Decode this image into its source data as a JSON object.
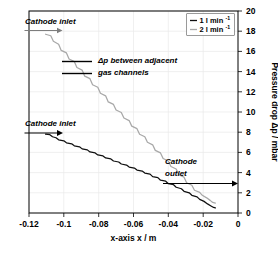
{
  "chart_data": {
    "type": "line",
    "title": "",
    "xlabel": "x-axis  x / m",
    "ylabel": "Pressure drop Δp / mbar",
    "xlim": [
      -0.12,
      0
    ],
    "ylim": [
      0,
      20
    ],
    "xticks": [
      -0.12,
      -0.1,
      -0.08,
      -0.06,
      -0.04,
      -0.02,
      0
    ],
    "xticklabels": [
      "-0.12",
      "-0.1",
      "-0.08",
      "-0.06",
      "-0.04",
      "-0.02",
      "0"
    ],
    "yticks": [
      0,
      2,
      4,
      6,
      8,
      10,
      12,
      14,
      16,
      18,
      20
    ],
    "yticklabels": [
      "0",
      "2",
      "4",
      "6",
      "8",
      "10",
      "12",
      "14",
      "16",
      "18",
      "20"
    ],
    "y_axis_position": "right",
    "grid": true,
    "legend_position": "top-right",
    "series": [
      {
        "name": "1 l min⁻¹",
        "color": "#101010",
        "x": [
          -0.1105,
          -0.108,
          -0.1065,
          -0.1045,
          -0.103,
          -0.1,
          -0.0985,
          -0.0955,
          -0.094,
          -0.091,
          -0.0895,
          -0.0865,
          -0.085,
          -0.082,
          -0.0805,
          -0.0775,
          -0.076,
          -0.073,
          -0.0715,
          -0.0685,
          -0.067,
          -0.064,
          -0.0625,
          -0.0595,
          -0.058,
          -0.055,
          -0.0535,
          -0.0505,
          -0.049,
          -0.046,
          -0.0445,
          -0.0415,
          -0.04,
          -0.037,
          -0.0355,
          -0.0325,
          -0.031,
          -0.028,
          -0.0265,
          -0.0235,
          -0.022,
          -0.0195,
          -0.0175,
          -0.0155,
          -0.014,
          -0.013
        ],
        "y": [
          7.8,
          7.75,
          7.55,
          7.45,
          7.25,
          7.15,
          6.95,
          6.85,
          6.65,
          6.55,
          6.35,
          6.25,
          6.05,
          5.95,
          5.75,
          5.65,
          5.45,
          5.35,
          5.15,
          5.05,
          4.85,
          4.75,
          4.55,
          4.45,
          4.25,
          4.15,
          3.95,
          3.85,
          3.6,
          3.5,
          3.25,
          3.15,
          2.9,
          2.8,
          2.55,
          2.4,
          2.15,
          2.0,
          1.75,
          1.6,
          1.35,
          1.15,
          0.9,
          0.7,
          0.55,
          0.5
        ]
      },
      {
        "name": "2 l min⁻¹",
        "color": "#a8a8a8",
        "x": [
          -0.1105,
          -0.1075,
          -0.106,
          -0.103,
          -0.1015,
          -0.0985,
          -0.097,
          -0.094,
          -0.0925,
          -0.0895,
          -0.088,
          -0.085,
          -0.0835,
          -0.0805,
          -0.079,
          -0.076,
          -0.0745,
          -0.0715,
          -0.07,
          -0.067,
          -0.0655,
          -0.0625,
          -0.061,
          -0.058,
          -0.0565,
          -0.0535,
          -0.052,
          -0.049,
          -0.0475,
          -0.0445,
          -0.043,
          -0.04,
          -0.0385,
          -0.0355,
          -0.034,
          -0.031,
          -0.0295,
          -0.0265,
          -0.025,
          -0.022,
          -0.0205,
          -0.018,
          -0.016,
          -0.0145,
          -0.013
        ],
        "y": [
          17.7,
          17.55,
          17.0,
          16.7,
          16.1,
          15.85,
          15.25,
          15.0,
          14.4,
          14.15,
          13.55,
          13.3,
          12.7,
          12.45,
          11.85,
          11.6,
          11.0,
          10.75,
          10.2,
          9.95,
          9.4,
          9.15,
          8.6,
          8.35,
          7.8,
          7.55,
          7.0,
          6.75,
          6.2,
          5.95,
          5.4,
          5.15,
          4.6,
          4.35,
          3.8,
          3.55,
          3.0,
          2.75,
          2.25,
          2.05,
          1.75,
          1.5,
          1.25,
          1.05,
          0.98
        ]
      }
    ],
    "annotations": [
      {
        "id": "cathode-inlet-upper",
        "text": "Cathode inlet",
        "series": "2 l min⁻¹"
      },
      {
        "id": "cathode-inlet-lower",
        "text": "Cathode inlet",
        "series": "1 l min⁻¹"
      },
      {
        "id": "delta-p-note-line1",
        "text": "Δp between adjacent"
      },
      {
        "id": "delta-p-note-line2",
        "text": "gas channels"
      },
      {
        "id": "cathode-outlet-line1",
        "text": "Cathode"
      },
      {
        "id": "cathode-outlet-line2",
        "text": "outlet"
      }
    ]
  },
  "legend": {
    "entries": [
      {
        "base": "1 l min",
        "sup": "-1"
      },
      {
        "base": "2 l min",
        "sup": "-1"
      }
    ]
  }
}
